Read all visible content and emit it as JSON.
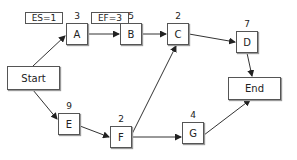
{
  "diagram": {
    "type": "network-activity-diagram",
    "nodes": {
      "start": {
        "label": "Start"
      },
      "end": {
        "label": "End"
      },
      "A": {
        "label": "A",
        "duration": "3"
      },
      "B": {
        "label": "B",
        "duration": "5"
      },
      "C": {
        "label": "C",
        "duration": "2"
      },
      "D": {
        "label": "D",
        "duration": "7"
      },
      "E": {
        "label": "E",
        "duration": "9"
      },
      "F": {
        "label": "F",
        "duration": "2"
      },
      "G": {
        "label": "G",
        "duration": "4"
      }
    },
    "annotations": {
      "es": "ES=1",
      "ef": "EF=3"
    },
    "edges": [
      [
        "Start",
        "A"
      ],
      [
        "A",
        "B"
      ],
      [
        "B",
        "C"
      ],
      [
        "C",
        "D"
      ],
      [
        "D",
        "End"
      ],
      [
        "Start",
        "E"
      ],
      [
        "E",
        "F"
      ],
      [
        "F",
        "C"
      ],
      [
        "F",
        "G"
      ],
      [
        "G",
        "End"
      ]
    ]
  }
}
